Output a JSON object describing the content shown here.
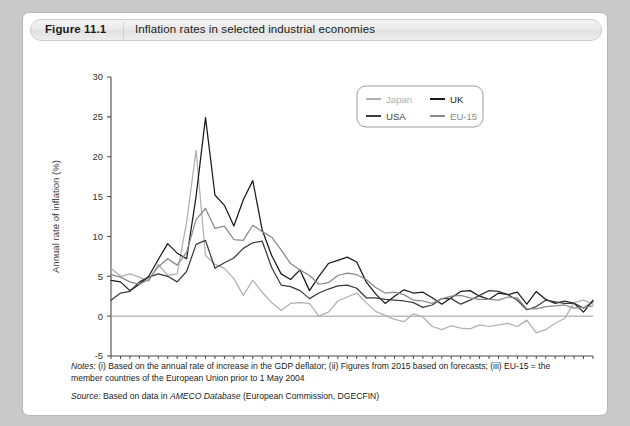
{
  "header": {
    "figure_number": "Figure 11.1",
    "title": "Inflation rates in selected industrial economies"
  },
  "notes": {
    "lead": "Notes:",
    "line1": " (i) Based on the annual rate of increase in the GDP deflator; (ii) Figures from 2015 based on forecasts; (iii) EU-15 = the",
    "line2": "member countries of the European Union prior to 1 May 2004",
    "source_lead": "Source:",
    "source_pre": " Based on data in ",
    "source_italic": "AMECO Database",
    "source_post": " (European Commission, DGECFIN)"
  },
  "colors": {
    "japan": "#b0b0b0",
    "uk": "#1a1a1a",
    "usa": "#3c3c3c",
    "eu15": "#8a8a8a",
    "axis": "#4a4a4a",
    "zero_line": "#9a9a9a",
    "panel_bg": "#ffffff",
    "page_bg": "#c9c9c9"
  },
  "chart_data": {
    "type": "line",
    "title": "Inflation rates in selected industrial economies",
    "xlabel": "",
    "ylabel": "Annual rate of inflation (%)",
    "xlim": [
      1965,
      2016
    ],
    "ylim": [
      -5,
      30
    ],
    "yticks": [
      -5,
      0,
      5,
      10,
      15,
      20,
      25,
      30
    ],
    "xticks": [
      1965,
      1970,
      1975,
      1980,
      1985,
      1990,
      1995,
      2000,
      2005,
      2010,
      2015
    ],
    "xtick_minor_step": 1,
    "grid": false,
    "legend_position": "top-right",
    "legend_entries": [
      "Japan",
      "UK",
      "USA",
      "EU-15"
    ],
    "x": [
      1965,
      1966,
      1967,
      1968,
      1969,
      1970,
      1971,
      1972,
      1973,
      1974,
      1975,
      1976,
      1977,
      1978,
      1979,
      1980,
      1981,
      1982,
      1983,
      1984,
      1985,
      1986,
      1987,
      1988,
      1989,
      1990,
      1991,
      1992,
      1993,
      1994,
      1995,
      1996,
      1997,
      1998,
      1999,
      2000,
      2001,
      2002,
      2003,
      2004,
      2005,
      2006,
      2007,
      2008,
      2009,
      2010,
      2011,
      2012,
      2013,
      2014,
      2015,
      2016
    ],
    "series": [
      {
        "name": "Japan",
        "color": "#b0b0b0",
        "values": [
          6.0,
          5.0,
          5.3,
          4.9,
          4.4,
          6.5,
          5.1,
          5.3,
          11.8,
          20.8,
          7.6,
          6.5,
          6.0,
          4.7,
          2.6,
          4.5,
          3.0,
          1.7,
          0.7,
          1.6,
          1.7,
          1.6,
          0.0,
          0.5,
          1.9,
          2.4,
          2.9,
          1.7,
          0.6,
          0.1,
          -0.4,
          -0.7,
          0.3,
          -0.1,
          -1.3,
          -1.7,
          -1.2,
          -1.5,
          -1.6,
          -1.1,
          -1.3,
          -1.1,
          -0.9,
          -1.3,
          -0.5,
          -2.1,
          -1.7,
          -0.9,
          -0.3,
          1.7,
          2.0,
          1.5
        ]
      },
      {
        "name": "UK",
        "color": "#1a1a1a",
        "values": [
          4.5,
          4.3,
          3.2,
          4.0,
          5.0,
          7.1,
          9.1,
          7.9,
          7.2,
          15.0,
          24.9,
          15.2,
          13.9,
          11.3,
          14.6,
          17.0,
          10.8,
          7.6,
          5.3,
          4.6,
          5.8,
          3.2,
          5.0,
          6.6,
          7.0,
          7.4,
          6.8,
          4.3,
          2.8,
          1.6,
          2.5,
          3.3,
          2.9,
          3.0,
          2.3,
          1.5,
          2.3,
          3.1,
          3.2,
          2.5,
          2.1,
          2.9,
          2.7,
          3.0,
          1.5,
          3.1,
          2.1,
          1.6,
          1.9,
          1.6,
          0.5,
          2.0
        ]
      },
      {
        "name": "USA",
        "color": "#3c3c3c",
        "values": [
          2.0,
          2.9,
          3.1,
          4.3,
          4.9,
          5.3,
          5.0,
          4.3,
          5.6,
          9.0,
          9.5,
          6.0,
          6.7,
          7.3,
          8.5,
          9.2,
          9.4,
          6.1,
          3.9,
          3.7,
          3.2,
          2.2,
          2.9,
          3.4,
          3.8,
          3.9,
          3.5,
          2.3,
          2.3,
          2.1,
          2.0,
          1.9,
          1.7,
          1.1,
          1.4,
          2.2,
          2.2,
          1.5,
          2.0,
          2.6,
          3.2,
          3.1,
          2.7,
          2.0,
          0.8,
          1.2,
          2.0,
          1.8,
          1.6,
          1.6,
          1.0,
          1.8
        ]
      },
      {
        "name": "EU-15",
        "color": "#8a8a8a",
        "values": [
          5.2,
          4.9,
          4.3,
          4.0,
          4.6,
          6.2,
          7.2,
          6.4,
          8.0,
          12.1,
          13.5,
          11.0,
          11.3,
          9.6,
          9.5,
          11.4,
          10.6,
          9.9,
          8.3,
          6.6,
          5.8,
          5.1,
          4.0,
          4.2,
          5.1,
          5.4,
          5.2,
          4.6,
          3.6,
          2.9,
          3.0,
          2.7,
          2.0,
          1.9,
          1.6,
          2.2,
          2.5,
          2.6,
          2.3,
          2.1,
          2.1,
          2.0,
          2.4,
          2.3,
          0.9,
          0.9,
          1.2,
          1.3,
          1.4,
          1.0,
          1.1,
          1.3
        ]
      }
    ]
  }
}
